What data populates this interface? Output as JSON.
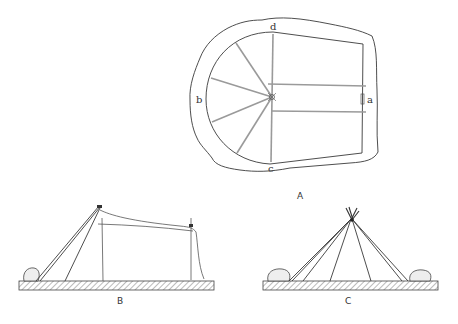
{
  "figure": {
    "panels": [
      {
        "id": "A",
        "caption": "A",
        "description": "Plan view of a hut floor with semicircular end, radiating poles from a center point"
      },
      {
        "id": "B",
        "caption": "B",
        "description": "Side elevation of frame with leaning poles and horizontal ridge, stone at base"
      },
      {
        "id": "C",
        "caption": "C",
        "description": "Front elevation of conical tent frame with poles converging at apex, stones at both ends"
      }
    ],
    "plan_labels": {
      "a": "a",
      "b": "b",
      "c": "c",
      "d": "d"
    }
  }
}
